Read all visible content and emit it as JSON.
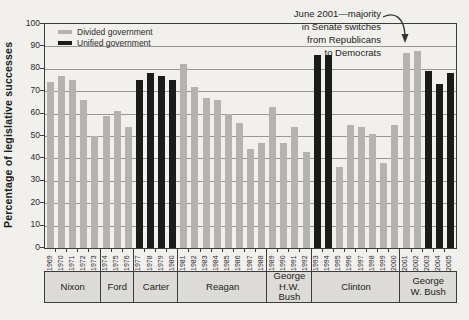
{
  "figure": {
    "y_axis_title": "Percentage of legislative successes",
    "legend": {
      "items": [
        {
          "label": "Divided government",
          "key": "divided"
        },
        {
          "label": "Unified government",
          "key": "unified"
        }
      ]
    },
    "annotation": {
      "lines": [
        "June 2001—majority",
        "in Senate switches",
        "from Republicans",
        "to Democrats"
      ]
    }
  },
  "chart_data": {
    "type": "bar",
    "title": "",
    "xlabel": "",
    "ylabel": "Percentage of legislative successes",
    "ylim": [
      0,
      100
    ],
    "y_tick_step": 10,
    "grid": true,
    "legend_position": "top-left",
    "colors": {
      "divided": "#b4b3af",
      "unified": "#1b1b1b"
    },
    "bars": [
      {
        "year": "1969",
        "value": 74,
        "government": "divided"
      },
      {
        "year": "1970",
        "value": 77,
        "government": "divided"
      },
      {
        "year": "1971",
        "value": 75,
        "government": "divided"
      },
      {
        "year": "1972",
        "value": 66,
        "government": "divided"
      },
      {
        "year": "1973",
        "value": 50,
        "government": "divided"
      },
      {
        "year": "1974",
        "value": 59,
        "government": "divided"
      },
      {
        "year": "1975",
        "value": 61,
        "government": "divided"
      },
      {
        "year": "1976",
        "value": 54,
        "government": "divided"
      },
      {
        "year": "1977",
        "value": 75,
        "government": "unified"
      },
      {
        "year": "1978",
        "value": 78,
        "government": "unified"
      },
      {
        "year": "1979",
        "value": 77,
        "government": "unified"
      },
      {
        "year": "1980",
        "value": 75,
        "government": "unified"
      },
      {
        "year": "1981",
        "value": 82,
        "government": "divided"
      },
      {
        "year": "1982",
        "value": 72,
        "government": "divided"
      },
      {
        "year": "1983",
        "value": 67,
        "government": "divided"
      },
      {
        "year": "1984",
        "value": 66,
        "government": "divided"
      },
      {
        "year": "1985",
        "value": 60,
        "government": "divided"
      },
      {
        "year": "1986",
        "value": 56,
        "government": "divided"
      },
      {
        "year": "1987",
        "value": 44,
        "government": "divided"
      },
      {
        "year": "1988",
        "value": 47,
        "government": "divided"
      },
      {
        "year": "1989",
        "value": 63,
        "government": "divided"
      },
      {
        "year": "1990",
        "value": 47,
        "government": "divided"
      },
      {
        "year": "1991",
        "value": 54,
        "government": "divided"
      },
      {
        "year": "1992",
        "value": 43,
        "government": "divided"
      },
      {
        "year": "1993",
        "value": 86,
        "government": "unified"
      },
      {
        "year": "1994",
        "value": 86,
        "government": "unified"
      },
      {
        "year": "1995",
        "value": 36,
        "government": "divided"
      },
      {
        "year": "1996",
        "value": 55,
        "government": "divided"
      },
      {
        "year": "1997",
        "value": 54,
        "government": "divided"
      },
      {
        "year": "1998",
        "value": 51,
        "government": "divided"
      },
      {
        "year": "1999",
        "value": 38,
        "government": "divided"
      },
      {
        "year": "2000",
        "value": 55,
        "government": "divided"
      },
      {
        "year": "2001",
        "value": 87,
        "government": "divided"
      },
      {
        "year": "2002",
        "value": 88,
        "government": "divided"
      },
      {
        "year": "2003",
        "value": 79,
        "government": "unified"
      },
      {
        "year": "2004",
        "value": 73,
        "government": "unified"
      },
      {
        "year": "2005",
        "value": 78,
        "government": "unified"
      }
    ],
    "president_groups": [
      {
        "name": "Nixon",
        "label_lines": [
          "Nixon"
        ],
        "start_year": "1969",
        "end_year": "1973"
      },
      {
        "name": "Ford",
        "label_lines": [
          "Ford"
        ],
        "start_year": "1974",
        "end_year": "1976"
      },
      {
        "name": "Carter",
        "label_lines": [
          "Carter"
        ],
        "start_year": "1977",
        "end_year": "1980"
      },
      {
        "name": "Reagan",
        "label_lines": [
          "Reagan"
        ],
        "start_year": "1981",
        "end_year": "1988"
      },
      {
        "name": "George H.W. Bush",
        "label_lines": [
          "George",
          "H.W. Bush"
        ],
        "start_year": "1989",
        "end_year": "1992"
      },
      {
        "name": "Clinton",
        "label_lines": [
          "Clinton"
        ],
        "start_year": "1993",
        "end_year": "2000"
      },
      {
        "name": "George W. Bush",
        "label_lines": [
          "George",
          "W. Bush"
        ],
        "start_year": "2001",
        "end_year": "2005"
      }
    ],
    "annotation": {
      "text": "June 2001—majority in Senate switches from Republicans to Democrats",
      "points_to_year": "2001"
    }
  }
}
